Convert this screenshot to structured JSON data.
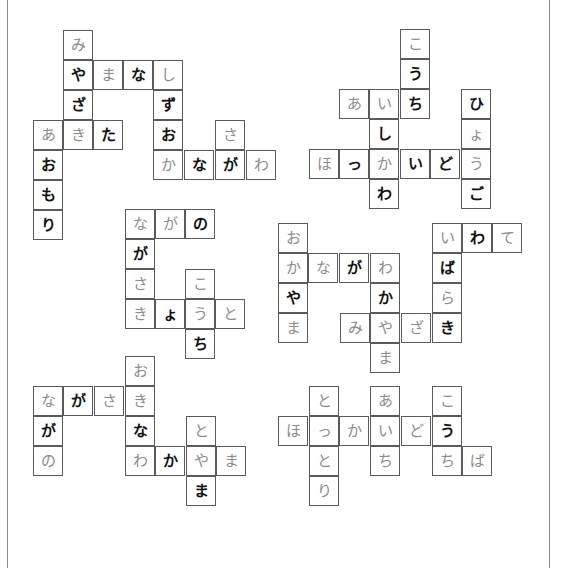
{
  "page": {
    "title": ""
  },
  "colors": {
    "gray_text": "#8c8c8c",
    "black_text": "#111111",
    "border": "#5a5a5a",
    "frame": "#8a8a8a"
  },
  "frame": {
    "left_x": 7,
    "right_x": 549
  },
  "cell_size": 30,
  "blocks": [
    {
      "name": "block-top-left",
      "cells": [
        {
          "x": 63,
          "y": 30,
          "ch": "み",
          "tone": "gray"
        },
        {
          "x": 63,
          "y": 60,
          "ch": "や",
          "tone": "black"
        },
        {
          "x": 93,
          "y": 60,
          "ch": "ま",
          "tone": "gray"
        },
        {
          "x": 123,
          "y": 60,
          "ch": "な",
          "tone": "black"
        },
        {
          "x": 153,
          "y": 60,
          "ch": "し",
          "tone": "gray"
        },
        {
          "x": 63,
          "y": 90,
          "ch": "ざ",
          "tone": "black"
        },
        {
          "x": 153,
          "y": 90,
          "ch": "ず",
          "tone": "black"
        },
        {
          "x": 33,
          "y": 120,
          "ch": "あ",
          "tone": "gray"
        },
        {
          "x": 63,
          "y": 120,
          "ch": "き",
          "tone": "gray"
        },
        {
          "x": 93,
          "y": 120,
          "ch": "た",
          "tone": "black"
        },
        {
          "x": 153,
          "y": 120,
          "ch": "お",
          "tone": "black"
        },
        {
          "x": 215,
          "y": 120,
          "ch": "さ",
          "tone": "gray"
        },
        {
          "x": 33,
          "y": 150,
          "ch": "お",
          "tone": "black"
        },
        {
          "x": 153,
          "y": 150,
          "ch": "か",
          "tone": "gray"
        },
        {
          "x": 184,
          "y": 150,
          "ch": "な",
          "tone": "black"
        },
        {
          "x": 215,
          "y": 150,
          "ch": "が",
          "tone": "black"
        },
        {
          "x": 246,
          "y": 150,
          "ch": "わ",
          "tone": "gray"
        },
        {
          "x": 33,
          "y": 180,
          "ch": "も",
          "tone": "black"
        },
        {
          "x": 33,
          "y": 210,
          "ch": "り",
          "tone": "black"
        }
      ]
    },
    {
      "name": "block-top-right",
      "cells": [
        {
          "x": 400,
          "y": 29,
          "ch": "こ",
          "tone": "gray"
        },
        {
          "x": 400,
          "y": 59,
          "ch": "う",
          "tone": "black"
        },
        {
          "x": 339,
          "y": 89,
          "ch": "あ",
          "tone": "gray"
        },
        {
          "x": 369,
          "y": 89,
          "ch": "い",
          "tone": "gray"
        },
        {
          "x": 400,
          "y": 89,
          "ch": "ち",
          "tone": "black"
        },
        {
          "x": 461,
          "y": 89,
          "ch": "ひ",
          "tone": "black"
        },
        {
          "x": 369,
          "y": 119,
          "ch": "し",
          "tone": "black"
        },
        {
          "x": 461,
          "y": 119,
          "ch": "ょ",
          "tone": "gray"
        },
        {
          "x": 309,
          "y": 149,
          "ch": "ほ",
          "tone": "gray"
        },
        {
          "x": 339,
          "y": 149,
          "ch": "っ",
          "tone": "black"
        },
        {
          "x": 369,
          "y": 149,
          "ch": "か",
          "tone": "gray"
        },
        {
          "x": 400,
          "y": 149,
          "ch": "い",
          "tone": "black"
        },
        {
          "x": 430,
          "y": 149,
          "ch": "ど",
          "tone": "black"
        },
        {
          "x": 461,
          "y": 149,
          "ch": "う",
          "tone": "gray"
        },
        {
          "x": 369,
          "y": 179,
          "ch": "わ",
          "tone": "black"
        },
        {
          "x": 461,
          "y": 179,
          "ch": "ご",
          "tone": "black"
        }
      ]
    },
    {
      "name": "block-middle-left",
      "cells": [
        {
          "x": 125,
          "y": 209,
          "ch": "な",
          "tone": "gray"
        },
        {
          "x": 155,
          "y": 209,
          "ch": "が",
          "tone": "gray"
        },
        {
          "x": 185,
          "y": 209,
          "ch": "の",
          "tone": "black"
        },
        {
          "x": 125,
          "y": 239,
          "ch": "が",
          "tone": "black"
        },
        {
          "x": 125,
          "y": 269,
          "ch": "さ",
          "tone": "gray"
        },
        {
          "x": 185,
          "y": 269,
          "ch": "こ",
          "tone": "gray"
        },
        {
          "x": 125,
          "y": 299,
          "ch": "き",
          "tone": "gray"
        },
        {
          "x": 155,
          "y": 299,
          "ch": "ょ",
          "tone": "black"
        },
        {
          "x": 185,
          "y": 299,
          "ch": "う",
          "tone": "gray"
        },
        {
          "x": 215,
          "y": 299,
          "ch": "と",
          "tone": "gray"
        },
        {
          "x": 185,
          "y": 329,
          "ch": "ち",
          "tone": "black"
        }
      ]
    },
    {
      "name": "block-middle-right",
      "cells": [
        {
          "x": 278,
          "y": 223,
          "ch": "お",
          "tone": "gray"
        },
        {
          "x": 432,
          "y": 223,
          "ch": "い",
          "tone": "gray"
        },
        {
          "x": 462,
          "y": 223,
          "ch": "わ",
          "tone": "black"
        },
        {
          "x": 492,
          "y": 223,
          "ch": "て",
          "tone": "gray"
        },
        {
          "x": 278,
          "y": 253,
          "ch": "か",
          "tone": "gray"
        },
        {
          "x": 308,
          "y": 253,
          "ch": "な",
          "tone": "gray"
        },
        {
          "x": 339,
          "y": 253,
          "ch": "が",
          "tone": "black"
        },
        {
          "x": 370,
          "y": 253,
          "ch": "わ",
          "tone": "gray"
        },
        {
          "x": 432,
          "y": 253,
          "ch": "ば",
          "tone": "black"
        },
        {
          "x": 278,
          "y": 283,
          "ch": "や",
          "tone": "black"
        },
        {
          "x": 370,
          "y": 283,
          "ch": "か",
          "tone": "black"
        },
        {
          "x": 432,
          "y": 283,
          "ch": "ら",
          "tone": "gray"
        },
        {
          "x": 278,
          "y": 313,
          "ch": "ま",
          "tone": "gray"
        },
        {
          "x": 340,
          "y": 313,
          "ch": "み",
          "tone": "gray"
        },
        {
          "x": 370,
          "y": 313,
          "ch": "や",
          "tone": "gray"
        },
        {
          "x": 401,
          "y": 313,
          "ch": "ざ",
          "tone": "gray"
        },
        {
          "x": 432,
          "y": 313,
          "ch": "き",
          "tone": "black"
        },
        {
          "x": 370,
          "y": 343,
          "ch": "ま",
          "tone": "gray"
        }
      ]
    },
    {
      "name": "block-bottom-left",
      "cells": [
        {
          "x": 125,
          "y": 356,
          "ch": "お",
          "tone": "gray"
        },
        {
          "x": 33,
          "y": 386,
          "ch": "な",
          "tone": "gray"
        },
        {
          "x": 63,
          "y": 386,
          "ch": "が",
          "tone": "black"
        },
        {
          "x": 94,
          "y": 386,
          "ch": "さ",
          "tone": "gray"
        },
        {
          "x": 125,
          "y": 386,
          "ch": "き",
          "tone": "gray"
        },
        {
          "x": 33,
          "y": 416,
          "ch": "が",
          "tone": "black"
        },
        {
          "x": 125,
          "y": 416,
          "ch": "な",
          "tone": "black"
        },
        {
          "x": 186,
          "y": 416,
          "ch": "と",
          "tone": "gray"
        },
        {
          "x": 33,
          "y": 446,
          "ch": "の",
          "tone": "gray"
        },
        {
          "x": 125,
          "y": 446,
          "ch": "わ",
          "tone": "gray"
        },
        {
          "x": 155,
          "y": 446,
          "ch": "か",
          "tone": "black"
        },
        {
          "x": 186,
          "y": 446,
          "ch": "や",
          "tone": "gray"
        },
        {
          "x": 216,
          "y": 446,
          "ch": "ま",
          "tone": "gray"
        },
        {
          "x": 186,
          "y": 476,
          "ch": "ま",
          "tone": "black"
        }
      ]
    },
    {
      "name": "block-bottom-right",
      "cells": [
        {
          "x": 309,
          "y": 386,
          "ch": "と",
          "tone": "gray"
        },
        {
          "x": 370,
          "y": 386,
          "ch": "あ",
          "tone": "gray"
        },
        {
          "x": 432,
          "y": 386,
          "ch": "こ",
          "tone": "gray"
        },
        {
          "x": 278,
          "y": 416,
          "ch": "ほ",
          "tone": "gray"
        },
        {
          "x": 309,
          "y": 416,
          "ch": "っ",
          "tone": "gray"
        },
        {
          "x": 339,
          "y": 416,
          "ch": "か",
          "tone": "gray"
        },
        {
          "x": 370,
          "y": 416,
          "ch": "い",
          "tone": "gray"
        },
        {
          "x": 401,
          "y": 416,
          "ch": "ど",
          "tone": "gray"
        },
        {
          "x": 432,
          "y": 416,
          "ch": "う",
          "tone": "black"
        },
        {
          "x": 309,
          "y": 446,
          "ch": "と",
          "tone": "gray"
        },
        {
          "x": 370,
          "y": 446,
          "ch": "ち",
          "tone": "gray"
        },
        {
          "x": 432,
          "y": 446,
          "ch": "ち",
          "tone": "gray"
        },
        {
          "x": 462,
          "y": 446,
          "ch": "ば",
          "tone": "gray"
        },
        {
          "x": 309,
          "y": 476,
          "ch": "り",
          "tone": "gray"
        }
      ]
    }
  ]
}
